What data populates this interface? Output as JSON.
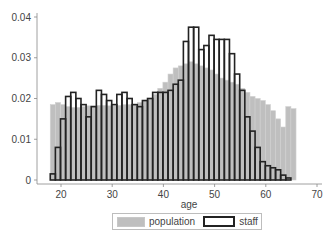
{
  "chart_data": {
    "type": "bar",
    "title": "",
    "xlabel": "age",
    "ylabel": "",
    "xlim": [
      17,
      70
    ],
    "ylim": [
      0,
      0.04
    ],
    "x_ticks": [
      20,
      30,
      40,
      50,
      60,
      70
    ],
    "y_ticks": [
      0,
      0.01,
      0.02,
      0.03,
      0.04
    ],
    "y_tick_labels": [
      "0",
      "0.01",
      "0.02",
      "0.03",
      "0.04"
    ],
    "grid": false,
    "legend_position": "bottom",
    "series": [
      {
        "name": "population",
        "style": "filled gray histogram",
        "color": "#bfbfbf",
        "x": [
          18,
          19,
          20,
          21,
          22,
          23,
          24,
          25,
          26,
          27,
          28,
          29,
          30,
          31,
          32,
          33,
          34,
          35,
          36,
          37,
          38,
          39,
          40,
          41,
          42,
          43,
          44,
          45,
          46,
          47,
          48,
          49,
          50,
          51,
          52,
          53,
          54,
          55,
          56,
          57,
          58,
          59,
          60,
          61,
          62,
          63,
          64,
          65
        ],
        "values": [
          0.0185,
          0.019,
          0.0185,
          0.018,
          0.0178,
          0.0178,
          0.018,
          0.0182,
          0.0182,
          0.0183,
          0.0183,
          0.0182,
          0.0182,
          0.0183,
          0.0185,
          0.0185,
          0.0185,
          0.019,
          0.0195,
          0.02,
          0.021,
          0.0225,
          0.024,
          0.026,
          0.0275,
          0.028,
          0.0285,
          0.029,
          0.0285,
          0.028,
          0.0275,
          0.027,
          0.026,
          0.025,
          0.0245,
          0.024,
          0.0235,
          0.0225,
          0.0215,
          0.0205,
          0.02,
          0.0195,
          0.0185,
          0.017,
          0.015,
          0.013,
          0.018,
          0.0175
        ]
      },
      {
        "name": "staff",
        "style": "outlined black histogram",
        "color": "#222222",
        "x": [
          18,
          19,
          20,
          21,
          22,
          23,
          24,
          25,
          26,
          27,
          28,
          29,
          30,
          31,
          32,
          33,
          34,
          35,
          36,
          37,
          38,
          39,
          40,
          41,
          42,
          43,
          44,
          45,
          46,
          47,
          48,
          49,
          50,
          51,
          52,
          53,
          54,
          55,
          56,
          57,
          58,
          59,
          60,
          61,
          62,
          63,
          64
        ],
        "values": [
          0.0015,
          0.008,
          0.015,
          0.0205,
          0.0215,
          0.02,
          0.0185,
          0.0155,
          0.018,
          0.022,
          0.021,
          0.0195,
          0.0185,
          0.021,
          0.0215,
          0.02,
          0.0185,
          0.018,
          0.0195,
          0.02,
          0.0215,
          0.0215,
          0.0215,
          0.022,
          0.0235,
          0.0245,
          0.034,
          0.0375,
          0.0375,
          0.032,
          0.033,
          0.0355,
          0.0345,
          0.0345,
          0.0345,
          0.031,
          0.026,
          0.022,
          0.0155,
          0.012,
          0.008,
          0.0045,
          0.0035,
          0.003,
          0.0025,
          0.0012,
          0.0005
        ]
      }
    ]
  },
  "legend": {
    "population_label": "population",
    "staff_label": "staff"
  },
  "axis": {
    "x_title": "age"
  }
}
